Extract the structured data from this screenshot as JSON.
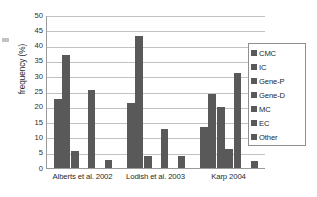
{
  "chart_data": {
    "type": "bar",
    "title": "",
    "subtitle": "",
    "xlabel": "",
    "ylabel": "frequency (%)",
    "categories": [
      "Alberts et al. 2002",
      "Lodish et al. 2003",
      "Karp 2004"
    ],
    "series": [
      {
        "name": "CMC",
        "values": [
          22.7,
          21.4,
          13.3
        ]
      },
      {
        "name": "IC",
        "values": [
          36.8,
          43.2,
          24.3
        ]
      },
      {
        "name": "Gene-P",
        "values": [
          5.5,
          3.9,
          20.1
        ]
      },
      {
        "name": "Gene-D",
        "values": [
          0,
          0,
          6.2
        ]
      },
      {
        "name": "MC",
        "values": [
          25.5,
          12.6,
          31.0
        ]
      },
      {
        "name": "EC",
        "values": [
          0,
          0,
          0
        ]
      },
      {
        "name": "Other",
        "values": [
          2.7,
          4.0,
          2.3
        ]
      }
    ],
    "ylim": [
      0,
      50
    ],
    "ytick_labels": [
      "0",
      "5",
      "10",
      "15",
      "20",
      "25",
      "30",
      "35",
      "40",
      "45",
      "50"
    ],
    "ytick_values": [
      0,
      5,
      10,
      15,
      20,
      25,
      30,
      35,
      40,
      45,
      50
    ],
    "grid": true,
    "grid_axis": "y",
    "legend_position": "right",
    "legend_entries": [
      "CMC",
      "IC",
      "Gene-P",
      "Gene-D",
      "MC",
      "EC",
      "Other"
    ],
    "bar_color": "#595959",
    "grid_color": "#c2c2c2",
    "axis_color": "#9a9a9a",
    "annotations": []
  }
}
